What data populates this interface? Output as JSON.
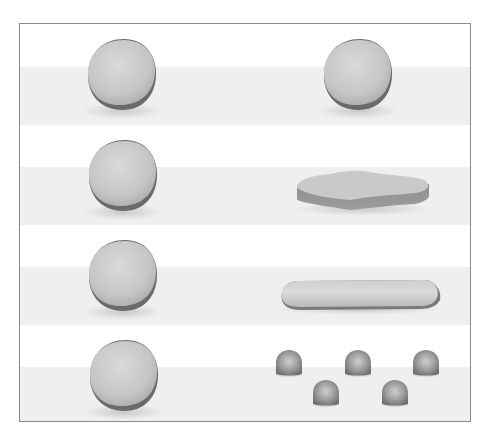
{
  "diagram": {
    "title": "",
    "colors": {
      "frame_border": "#8a8a8a",
      "band": "#efefef",
      "clay_light": "#d6d6d6",
      "clay_mid": "#bdbdbd",
      "clay_dark": "#6e6e6e",
      "shadow": "#d8d8d8"
    },
    "rows": [
      {
        "left": "ball",
        "right": "ball"
      },
      {
        "left": "ball",
        "right": "pancake"
      },
      {
        "left": "ball",
        "right": "sausage"
      },
      {
        "left": "ball",
        "right": "pieces",
        "piece_count": 5
      }
    ]
  }
}
